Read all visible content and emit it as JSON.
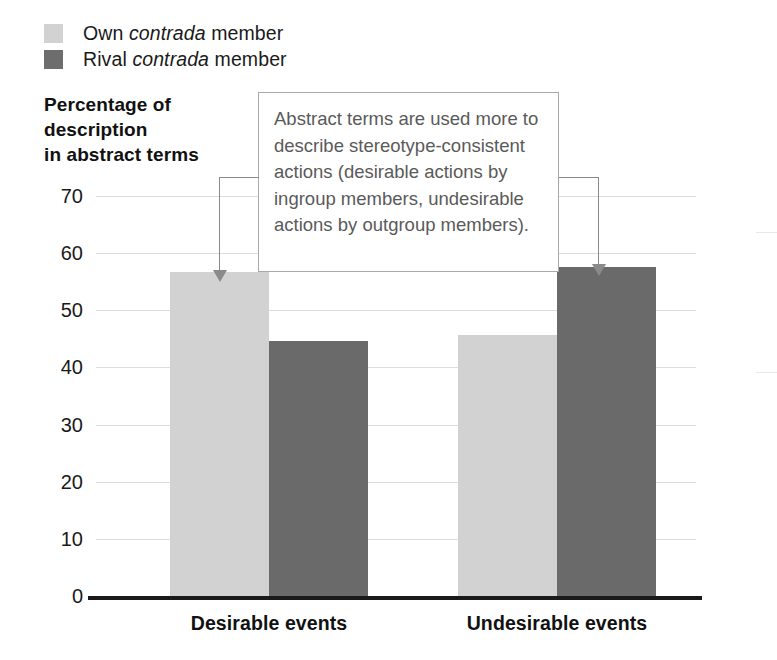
{
  "legend": {
    "items": [
      {
        "label_prefix": "Own ",
        "label_italic": "contrada",
        "label_suffix": " member",
        "color": "#d2d2d2",
        "name": "own-contrada-member"
      },
      {
        "label_prefix": "Rival ",
        "label_italic": "contrada",
        "label_suffix": " member",
        "color": "#6d6d6d",
        "name": "rival-contrada-member"
      }
    ]
  },
  "axis_title": {
    "line1": "Percentage of",
    "line2": "description",
    "line3": "in abstract terms"
  },
  "annotation": {
    "text": "Abstract terms are used more to describe stereotype-consistent actions (desirable actions by ingroup members, undesirable actions by outgroup members).",
    "border_color": "#a9a9a9",
    "text_color": "#5a5a5a"
  },
  "chart_data": {
    "type": "bar",
    "title": "",
    "xlabel": "",
    "ylabel": "Percentage of description in abstract terms",
    "ylim": [
      0,
      70
    ],
    "yticks": [
      0,
      10,
      20,
      30,
      40,
      50,
      60,
      70
    ],
    "grid": true,
    "legend_position": "top-left",
    "categories": [
      "Desirable events",
      "Undesirable events"
    ],
    "series": [
      {
        "name": "Own contrada member",
        "color": "#d2d2d2",
        "values": [
          57,
          46
        ]
      },
      {
        "name": "Rival contrada member",
        "color": "#6a6a6a",
        "values": [
          45,
          58
        ]
      }
    ],
    "annotations": [
      {
        "text": "Abstract terms are used more to describe stereotype-consistent actions (desirable actions by ingroup members, undesirable actions by outgroup members).",
        "points_to": [
          "Desirable events / Own contrada member",
          "Undesirable events / Rival contrada member"
        ]
      }
    ]
  }
}
